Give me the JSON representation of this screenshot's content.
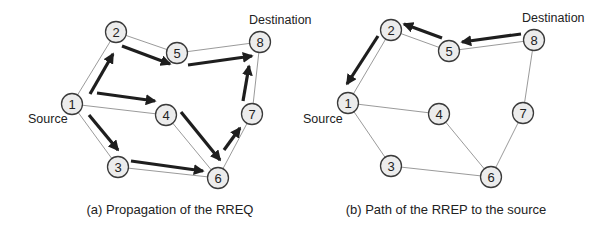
{
  "figure": {
    "panels": [
      {
        "id": "a",
        "caption": "(a) Propagation of the RREQ",
        "caption_pos": [
          170,
          214
        ],
        "source_label": "Source",
        "source_label_pos": [
          28,
          123
        ],
        "destination_label": "Destination",
        "destination_label_pos": [
          249,
          24
        ],
        "nodes": [
          {
            "id": "1",
            "label": "1",
            "x": 72,
            "y": 104
          },
          {
            "id": "2",
            "label": "2",
            "x": 116,
            "y": 32
          },
          {
            "id": "3",
            "label": "3",
            "x": 118,
            "y": 167
          },
          {
            "id": "4",
            "label": "4",
            "x": 166,
            "y": 115
          },
          {
            "id": "5",
            "label": "5",
            "x": 177,
            "y": 53
          },
          {
            "id": "6",
            "label": "6",
            "x": 218,
            "y": 178
          },
          {
            "id": "7",
            "label": "7",
            "x": 252,
            "y": 114
          },
          {
            "id": "8",
            "label": "8",
            "x": 260,
            "y": 42
          }
        ],
        "edges": [
          [
            "1",
            "2"
          ],
          [
            "1",
            "4"
          ],
          [
            "1",
            "3"
          ],
          [
            "2",
            "5"
          ],
          [
            "5",
            "8"
          ],
          [
            "4",
            "6"
          ],
          [
            "3",
            "6"
          ],
          [
            "6",
            "7"
          ],
          [
            "7",
            "8"
          ]
        ],
        "arrows": [
          {
            "from": "1",
            "to": "2",
            "x1": 90,
            "y1": 94,
            "x2": 113,
            "y2": 54
          },
          {
            "from": "2",
            "to": "5",
            "x1": 122,
            "y1": 46,
            "x2": 170,
            "y2": 64
          },
          {
            "from": "1",
            "to": "4",
            "x1": 97,
            "y1": 93,
            "x2": 155,
            "y2": 101
          },
          {
            "from": "1",
            "to": "3",
            "x1": 89,
            "y1": 115,
            "x2": 118,
            "y2": 150
          },
          {
            "from": "5",
            "to": "8",
            "x1": 188,
            "y1": 65,
            "x2": 252,
            "y2": 56
          },
          {
            "from": "4",
            "to": "6",
            "x1": 181,
            "y1": 112,
            "x2": 220,
            "y2": 160
          },
          {
            "from": "3",
            "to": "6",
            "x1": 131,
            "y1": 161,
            "x2": 203,
            "y2": 171
          },
          {
            "from": "6",
            "to": "7",
            "x1": 224,
            "y1": 150,
            "x2": 240,
            "y2": 128
          },
          {
            "from": "7",
            "to": "8",
            "x1": 243,
            "y1": 101,
            "x2": 249,
            "y2": 66
          }
        ]
      },
      {
        "id": "b",
        "caption": "(b) Path of the RREP to the source",
        "caption_pos": [
          446,
          214
        ],
        "source_label": "Source",
        "source_label_pos": [
          303,
          123
        ],
        "destination_label": "Destination",
        "destination_label_pos": [
          522,
          22
        ],
        "nodes": [
          {
            "id": "1",
            "label": "1",
            "x": 348,
            "y": 103
          },
          {
            "id": "2",
            "label": "2",
            "x": 391,
            "y": 30
          },
          {
            "id": "3",
            "label": "3",
            "x": 391,
            "y": 166
          },
          {
            "id": "4",
            "label": "4",
            "x": 439,
            "y": 114
          },
          {
            "id": "5",
            "label": "5",
            "x": 449,
            "y": 51
          },
          {
            "id": "6",
            "label": "6",
            "x": 491,
            "y": 177
          },
          {
            "id": "7",
            "label": "7",
            "x": 523,
            "y": 113
          },
          {
            "id": "8",
            "label": "8",
            "x": 534,
            "y": 40
          }
        ],
        "edges": [
          [
            "1",
            "2"
          ],
          [
            "2",
            "5"
          ],
          [
            "5",
            "8"
          ],
          [
            "1",
            "4"
          ],
          [
            "1",
            "3"
          ],
          [
            "4",
            "6"
          ],
          [
            "3",
            "6"
          ],
          [
            "6",
            "7"
          ],
          [
            "7",
            "8"
          ]
        ],
        "arrows": [
          {
            "from": "8",
            "to": "5",
            "x1": 521,
            "y1": 34,
            "x2": 462,
            "y2": 42
          },
          {
            "from": "5",
            "to": "2",
            "x1": 442,
            "y1": 38,
            "x2": 404,
            "y2": 24
          },
          {
            "from": "2",
            "to": "1",
            "x1": 378,
            "y1": 36,
            "x2": 347,
            "y2": 84
          }
        ]
      }
    ]
  },
  "colors": {
    "node_fill": "#ececec",
    "node_stroke": "#3a3a3a",
    "edge": "#8f8f8f",
    "arrow": "#1e1e1e",
    "text": "#222222",
    "background": "#ffffff"
  }
}
